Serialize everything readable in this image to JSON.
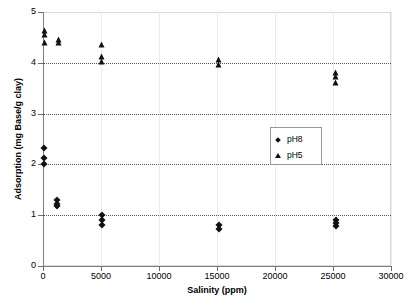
{
  "chart_data": {
    "type": "scatter",
    "title": "",
    "xlabel": "Salinity (ppm)",
    "ylabel": "Adsorption (mg Base/g clay)",
    "xlim": [
      0,
      30000
    ],
    "ylim": [
      0,
      5
    ],
    "xticks": [
      0,
      5000,
      10000,
      15000,
      20000,
      25000,
      30000
    ],
    "xtick_labels": [
      "0",
      "5000",
      "10000",
      "15000",
      "20000",
      "25000",
      "30000"
    ],
    "yticks": [
      0,
      1,
      2,
      3,
      4,
      5
    ],
    "ytick_labels": [
      "0",
      "1",
      "2",
      "3",
      "4",
      "5"
    ],
    "grid": "horizontal dotted gridlines at y=1,2,3,4; faint vertical gridlines at x ticks",
    "legend_position": "center-right inside plot",
    "series": [
      {
        "name": "pH8",
        "marker": "diamond",
        "color": "#111111",
        "points": [
          [
            120,
            2.32
          ],
          [
            120,
            2.12
          ],
          [
            120,
            2.0
          ],
          [
            1200,
            1.3
          ],
          [
            1200,
            1.22
          ],
          [
            1200,
            1.18
          ],
          [
            5100,
            1.0
          ],
          [
            5100,
            0.9
          ],
          [
            5100,
            0.8
          ],
          [
            15200,
            0.8
          ],
          [
            15200,
            0.72
          ],
          [
            25300,
            0.9
          ],
          [
            25300,
            0.84
          ],
          [
            25300,
            0.78
          ]
        ]
      },
      {
        "name": "pH5",
        "marker": "triangle",
        "color": "#111111",
        "points": [
          [
            150,
            4.62
          ],
          [
            150,
            4.54
          ],
          [
            150,
            4.38
          ],
          [
            1400,
            4.44
          ],
          [
            1400,
            4.38
          ],
          [
            5100,
            4.35
          ],
          [
            5100,
            4.12
          ],
          [
            5100,
            4.02
          ],
          [
            15200,
            4.05
          ],
          [
            15200,
            3.96
          ],
          [
            25300,
            3.8
          ],
          [
            25300,
            3.72
          ],
          [
            25300,
            3.6
          ]
        ]
      }
    ]
  },
  "legend": {
    "entries": [
      {
        "label": "pH8",
        "marker": "diamond"
      },
      {
        "label": "pH5",
        "marker": "triangle"
      }
    ]
  }
}
